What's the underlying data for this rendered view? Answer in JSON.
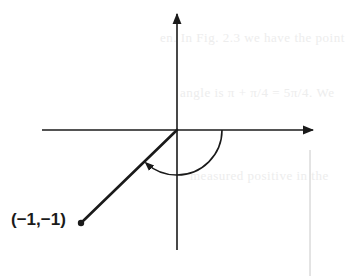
{
  "figure": {
    "type": "coordinate-plane",
    "point": {
      "label": "(−1,−1)",
      "x": -1,
      "y": -1
    },
    "angle_arc": {
      "direction": "clockwise",
      "from": "positive x-axis",
      "to": "ray through (-1,-1)",
      "sweep_degrees": 225
    },
    "colors": {
      "ink": "#1a1a1a",
      "bleed_text": "#ededed",
      "margin_rule": "#c8c8c8",
      "background": "#ffffff"
    }
  },
  "bleed_through": {
    "line1": "en. In Fig. 2.3 we have the point",
    "line2": "angle is π + π/4 = 5π/4. We",
    "line3": "measured positive in the"
  }
}
